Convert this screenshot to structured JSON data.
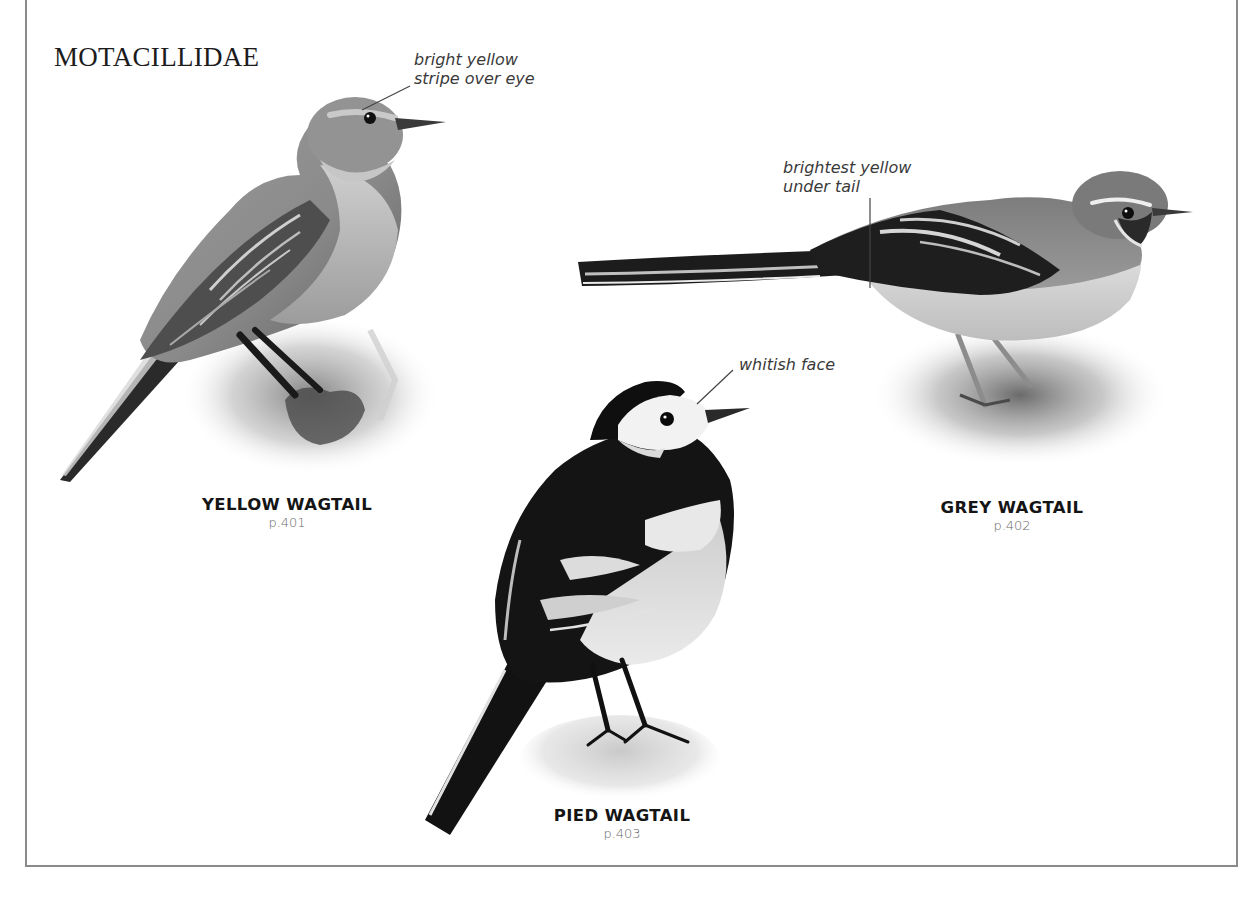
{
  "page": {
    "family_title": "MOTACILLIDAE",
    "colors": {
      "frame": "#8a8a8a",
      "text_dark": "#151515",
      "text_muted": "#6a6a6a",
      "annotation": "#3a3a3a"
    }
  },
  "species": [
    {
      "name": "YELLOW WAGTAIL",
      "page_ref": "p.401",
      "annotation": {
        "line1": "bright yellow",
        "line2": "stripe over eye"
      }
    },
    {
      "name": "GREY WAGTAIL",
      "page_ref": "p.402",
      "annotation": {
        "line1": "brightest yellow",
        "line2": "under tail"
      }
    },
    {
      "name": "PIED WAGTAIL",
      "page_ref": "p.403",
      "annotation": {
        "line1": "whitish face",
        "line2": ""
      }
    }
  ]
}
